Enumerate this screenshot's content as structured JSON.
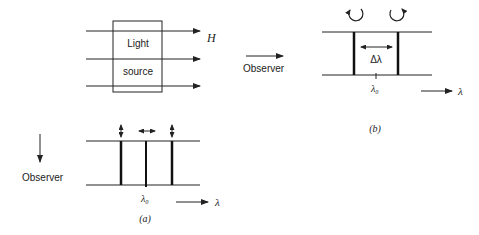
{
  "figure": {
    "panel_a_top": {
      "box_label_line1": "Light",
      "box_label_line2": "source",
      "field_label": "H"
    },
    "panel_a_bottom": {
      "observer_label": "Observer",
      "center_label": "λ₀",
      "axis_label": "λ",
      "caption": "(a)"
    },
    "panel_b": {
      "observer_label": "Observer",
      "splitting_label": "Δλ",
      "center_label": "λ₀",
      "axis_label": "λ",
      "caption": "(b)"
    }
  }
}
